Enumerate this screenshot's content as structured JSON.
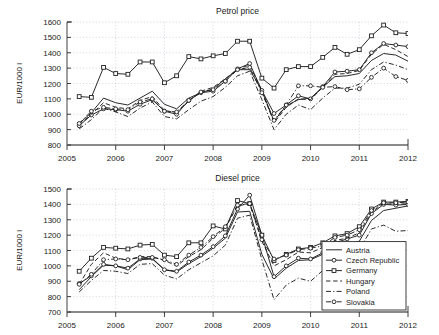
{
  "figure": {
    "width": 439,
    "height": 335,
    "background": "#ffffff",
    "ink_color": "#1f1f1f",
    "grid_color": "#b9b9c9"
  },
  "legend": {
    "position": "bottom-right",
    "entries": [
      {
        "label": "Austria",
        "style": "solid",
        "marker": "none"
      },
      {
        "label": "Czech Republic",
        "style": "solid",
        "marker": "circle"
      },
      {
        "label": "Germany",
        "style": "solid",
        "marker": "square"
      },
      {
        "label": "Hungary",
        "style": "dashed",
        "marker": "none"
      },
      {
        "label": "Poland",
        "style": "dashdot",
        "marker": "none"
      },
      {
        "label": "Slovakia",
        "style": "dashdot",
        "marker": "circle"
      }
    ]
  },
  "chart_data": [
    {
      "type": "line",
      "title": "Petrol price",
      "xlabel": "",
      "ylabel": "EUR/1000 l",
      "xlim": [
        2005,
        2012
      ],
      "ylim": [
        800,
        1600
      ],
      "yticks": [
        800,
        900,
        1000,
        1100,
        1200,
        1300,
        1400,
        1500,
        1600
      ],
      "xticks": [
        2005,
        2006,
        2007,
        2008,
        2009,
        2010,
        2011,
        2012
      ],
      "grid": true,
      "legend": false,
      "x": [
        2005.25,
        2005.5,
        2005.75,
        2006.0,
        2006.25,
        2006.5,
        2006.75,
        2007.0,
        2007.25,
        2007.5,
        2007.75,
        2008.0,
        2008.25,
        2008.5,
        2008.75,
        2009.0,
        2009.25,
        2009.5,
        2009.75,
        2010.0,
        2010.25,
        2010.5,
        2010.75,
        2011.0,
        2011.25,
        2011.5,
        2011.75,
        2012.0
      ],
      "series": [
        {
          "name": "Austria",
          "style": "solid",
          "marker": "none",
          "values": [
            940,
            1010,
            1105,
            1075,
            1060,
            1105,
            1150,
            1065,
            1035,
            1105,
            1140,
            1165,
            1230,
            1290,
            1290,
            1155,
            955,
            1055,
            1095,
            1105,
            1175,
            1245,
            1250,
            1265,
            1350,
            1395,
            1385,
            1345
          ]
        },
        {
          "name": "Czech Republic",
          "style": "solid",
          "marker": "circle",
          "values": [
            925,
            995,
            1035,
            1030,
            1020,
            1065,
            1095,
            1020,
            1000,
            1090,
            1140,
            1150,
            1215,
            1295,
            1330,
            1155,
            1005,
            1060,
            1120,
            1100,
            1180,
            1275,
            1280,
            1290,
            1400,
            1460,
            1450,
            1440
          ]
        },
        {
          "name": "Germany",
          "style": "solid",
          "marker": "square",
          "values": [
            1115,
            1110,
            1305,
            1265,
            1260,
            1340,
            1340,
            1205,
            1250,
            1375,
            1360,
            1380,
            1395,
            1475,
            1475,
            1235,
            1170,
            1290,
            1310,
            1310,
            1370,
            1435,
            1390,
            1420,
            1510,
            1580,
            1530,
            1525
          ]
        },
        {
          "name": "Hungary",
          "style": "dashed",
          "marker": "none",
          "values": [
            930,
            1000,
            1075,
            1045,
            1035,
            1090,
            1115,
            1025,
            1010,
            1085,
            1150,
            1175,
            1230,
            1295,
            1320,
            1150,
            945,
            1045,
            1100,
            1095,
            1175,
            1260,
            1265,
            1285,
            1390,
            1455,
            1420,
            1375
          ]
        },
        {
          "name": "Poland",
          "style": "dashdot",
          "marker": "none",
          "values": [
            905,
            965,
            1040,
            1015,
            985,
            1040,
            1080,
            985,
            970,
            1030,
            1085,
            1115,
            1175,
            1250,
            1280,
            1095,
            900,
            1000,
            1060,
            1030,
            1105,
            1170,
            1170,
            1195,
            1290,
            1340,
            1320,
            1290
          ]
        },
        {
          "name": "Slovakia",
          "style": "dashdot",
          "marker": "circle",
          "values": [
            940,
            1020,
            1045,
            1035,
            1030,
            1080,
            1100,
            1020,
            1015,
            1090,
            1145,
            1160,
            1215,
            1290,
            1305,
            1140,
            960,
            1060,
            1185,
            1185,
            1175,
            1180,
            1160,
            1165,
            1240,
            1300,
            1245,
            1220
          ]
        }
      ]
    },
    {
      "type": "line",
      "title": "Diesel price",
      "xlabel": "",
      "ylabel": "EUR/1000 l",
      "xlim": [
        2005,
        2012
      ],
      "ylim": [
        700,
        1500
      ],
      "yticks": [
        700,
        800,
        900,
        1000,
        1100,
        1200,
        1300,
        1400,
        1500
      ],
      "xticks": [
        2005,
        2006,
        2007,
        2008,
        2009,
        2010,
        2011,
        2012
      ],
      "grid": true,
      "legend": true,
      "x": [
        2005.25,
        2005.5,
        2005.75,
        2006.0,
        2006.25,
        2006.5,
        2006.75,
        2007.0,
        2007.25,
        2007.5,
        2007.75,
        2008.0,
        2008.25,
        2008.5,
        2008.75,
        2009.0,
        2009.25,
        2009.5,
        2009.75,
        2010.0,
        2010.25,
        2010.5,
        2010.75,
        2011.0,
        2011.25,
        2011.5,
        2011.75,
        2012.0
      ],
      "series": [
        {
          "name": "Austria",
          "style": "solid",
          "marker": "none",
          "values": [
            845,
            930,
            1005,
            1000,
            975,
            1040,
            1045,
            975,
            960,
            1015,
            1060,
            1115,
            1180,
            1350,
            1355,
            1075,
            915,
            985,
            1035,
            1040,
            1075,
            1130,
            1140,
            1160,
            1295,
            1360,
            1375,
            1390
          ]
        },
        {
          "name": "Czech Republic",
          "style": "solid",
          "marker": "circle",
          "values": [
            885,
            935,
            1010,
            1000,
            985,
            1045,
            1050,
            975,
            965,
            1025,
            1070,
            1125,
            1195,
            1370,
            1460,
            1200,
            930,
            1000,
            1050,
            1045,
            1085,
            1150,
            1175,
            1200,
            1340,
            1400,
            1395,
            1400
          ]
        },
        {
          "name": "Germany",
          "style": "solid",
          "marker": "square",
          "values": [
            965,
            1050,
            1120,
            1115,
            1110,
            1135,
            1140,
            1070,
            1060,
            1150,
            1150,
            1260,
            1240,
            1425,
            1405,
            1200,
            1035,
            1075,
            1110,
            1120,
            1150,
            1195,
            1210,
            1255,
            1370,
            1415,
            1415,
            1420
          ]
        },
        {
          "name": "Hungary",
          "style": "dashed",
          "marker": "none",
          "values": [
            880,
            1010,
            1085,
            1050,
            1040,
            1060,
            1060,
            1035,
            1000,
            1060,
            1105,
            1180,
            1245,
            1390,
            1405,
            1160,
            1000,
            1040,
            1090,
            1085,
            1120,
            1165,
            1180,
            1215,
            1350,
            1405,
            1400,
            1405
          ]
        },
        {
          "name": "Poland",
          "style": "dashdot",
          "marker": "none",
          "values": [
            830,
            905,
            970,
            965,
            950,
            1010,
            1015,
            940,
            915,
            975,
            1020,
            1065,
            1135,
            1310,
            1330,
            1040,
            780,
            875,
            920,
            900,
            970,
            1080,
            1085,
            1105,
            1240,
            1265,
            1225,
            1230
          ]
        },
        {
          "name": "Slovakia",
          "style": "dashdot",
          "marker": "circle",
          "values": [
            880,
            945,
            1040,
            1045,
            1040,
            1055,
            1055,
            1040,
            1010,
            1070,
            1120,
            1190,
            1255,
            1395,
            1405,
            1170,
            1045,
            1070,
            1105,
            1115,
            1130,
            1185,
            1200,
            1235,
            1360,
            1410,
            1410,
            1415
          ]
        }
      ]
    }
  ]
}
